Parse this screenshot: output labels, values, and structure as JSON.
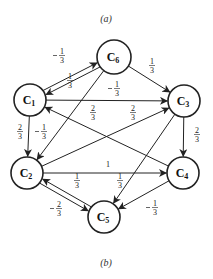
{
  "captions": {
    "top": "(a)",
    "bottom": "(b)"
  },
  "nodes": [
    {
      "id": "C6",
      "label": "C",
      "sub": "6",
      "x": 114,
      "y": 57,
      "r": 17
    },
    {
      "id": "C1",
      "label": "C",
      "sub": "1",
      "x": 30,
      "y": 100,
      "r": 16
    },
    {
      "id": "C3",
      "label": "C",
      "sub": "3",
      "x": 184,
      "y": 101,
      "r": 16
    },
    {
      "id": "C2",
      "label": "C",
      "sub": "2",
      "x": 27,
      "y": 173,
      "r": 16
    },
    {
      "id": "C4",
      "label": "C",
      "sub": "4",
      "x": 183,
      "y": 173,
      "r": 16
    },
    {
      "id": "C5",
      "label": "C",
      "sub": "5",
      "x": 104,
      "y": 217,
      "r": 16
    }
  ],
  "edges": [
    {
      "from": "C1",
      "to": "C6",
      "weight": "−1/3",
      "neg": true,
      "num": "1",
      "den": "3",
      "lx": 62,
      "ly": 55,
      "offset": -2.5
    },
    {
      "from": "C6",
      "to": "C1",
      "weight": "1/3",
      "neg": false,
      "num": "1",
      "den": "3",
      "lx": 70,
      "ly": 80,
      "offset": -2.5
    },
    {
      "from": "C6",
      "to": "C3",
      "weight": "1/3",
      "neg": false,
      "num": "1",
      "den": "3",
      "lx": 152,
      "ly": 65,
      "offset": 0
    },
    {
      "from": "C1",
      "to": "C3",
      "weight": "−1/3",
      "neg": true,
      "num": "1",
      "den": "3",
      "lx": 117,
      "ly": 88,
      "offset": 0
    },
    {
      "from": "C1",
      "to": "C2",
      "weight": "2/3",
      "neg": false,
      "num": "2",
      "den": "3",
      "lx": 20,
      "ly": 131,
      "offset": 0
    },
    {
      "from": "C6",
      "to": "C2",
      "weight": "−1/3",
      "neg": true,
      "num": "1",
      "den": "3",
      "lx": 44,
      "ly": 131,
      "offset": 0
    },
    {
      "from": "C4",
      "to": "C1",
      "weight": "2/3",
      "neg": false,
      "num": "2",
      "den": "3",
      "lx": 93,
      "ly": 112,
      "offset": 0
    },
    {
      "from": "C2",
      "to": "C3",
      "weight": "2/3",
      "neg": false,
      "num": "2",
      "den": "3",
      "lx": 133,
      "ly": 112,
      "offset": 0
    },
    {
      "from": "C3",
      "to": "C4",
      "weight": "2/3",
      "neg": false,
      "num": "2",
      "den": "3",
      "lx": 197,
      "ly": 134,
      "offset": 0
    },
    {
      "from": "C2",
      "to": "C4",
      "weight": "1",
      "neg": false,
      "num": "1",
      "den": "",
      "lx": 108,
      "ly": 167,
      "offset": 0
    },
    {
      "from": "C3",
      "to": "C5",
      "weight": "1/3",
      "neg": false,
      "num": "1",
      "den": "3",
      "lx": 120,
      "ly": 180,
      "offset": 0
    },
    {
      "from": "C2",
      "to": "C5",
      "weight": "1/3",
      "neg": false,
      "num": "1",
      "den": "3",
      "lx": 77,
      "ly": 180,
      "offset": 2.5
    },
    {
      "from": "C5",
      "to": "C2",
      "weight": "−2/3",
      "neg": true,
      "num": "2",
      "den": "3",
      "lx": 59,
      "ly": 208,
      "offset": 2.5
    },
    {
      "from": "C4",
      "to": "C5",
      "weight": "−1/3",
      "neg": true,
      "num": "1",
      "den": "3",
      "lx": 155,
      "ly": 207,
      "offset": 0
    }
  ]
}
